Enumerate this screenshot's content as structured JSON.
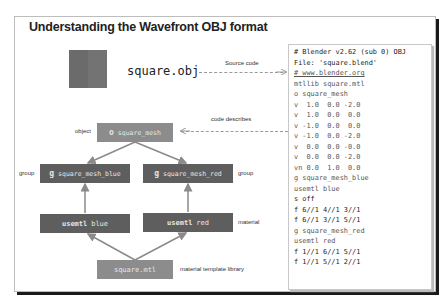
{
  "title": "Understanding the Wavefront OBJ format",
  "file_label": "square.obj",
  "arrows": {
    "source_code": "Source code",
    "code_describes": "code describes"
  },
  "diagram": {
    "object": {
      "label": "object",
      "keyword": "o",
      "name": "square_mesh"
    },
    "group_blue": {
      "label": "group",
      "keyword": "g",
      "name": "square_mesh_blue"
    },
    "group_red": {
      "label": "group",
      "keyword": "g",
      "name": "square_mesh_red"
    },
    "usemtl_blue": {
      "keyword": "usemtl",
      "name": "blue"
    },
    "usemtl_red": {
      "label": "material",
      "keyword": "usemtl",
      "name": "red"
    },
    "mtl": {
      "label": "material template library",
      "name": "square.mtl"
    }
  },
  "code": [
    "# Blender v2.62 (sub 0) OBJ",
    "File: 'square.blend'",
    "# www.blender.org",
    "mtllib square.mtl",
    "o square_mesh",
    "v  1.0  0.0 -2.0",
    "v  1.0  0.0  0.0",
    "v -1.0  0.0  0.0",
    "v -1.0  0.0 -2.0",
    "v  0.0  0.0 -0.0",
    "v  0.0  0.0 -2.0",
    "vn 0.0  1.0  0.0",
    "g square_mesh_blue",
    "usemtl blue",
    "s off",
    "f 6//1 4//1 3//1",
    "f 6//1 3//1 5//1",
    "g square_mesh_red",
    "usemtl red",
    "f 1//1 6//1 5//1",
    "f 1//1 5//1 2//1"
  ],
  "colors": {
    "box_light": "#8c8c8c",
    "box_dark": "#5e5e5e",
    "arrow": "#9a9a9a"
  }
}
